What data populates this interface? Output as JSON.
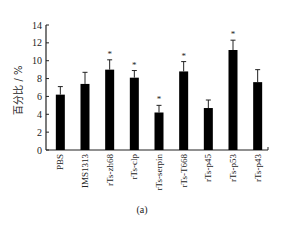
{
  "chart_data": {
    "type": "bar",
    "title": "",
    "caption": "(a)",
    "xlabel": "",
    "ylabel": "百分比 / %",
    "ylim": [
      0,
      14
    ],
    "yticks": [
      0,
      2,
      4,
      6,
      8,
      10,
      12,
      14
    ],
    "grid": false,
    "legend": null,
    "categories": [
      "PBS",
      "IMS1313",
      "rTs-zh68",
      "rTs-clp",
      "rTs-serpin",
      "rTs-T668",
      "rTs-p45",
      "rTs-p53",
      "rTs-p43"
    ],
    "values": [
      6.2,
      7.4,
      9.0,
      8.1,
      4.2,
      8.8,
      4.7,
      11.2,
      7.6
    ],
    "error_upper": [
      0.9,
      1.3,
      1.1,
      0.8,
      0.8,
      1.1,
      0.9,
      1.1,
      1.4
    ],
    "significance": [
      false,
      false,
      true,
      true,
      true,
      true,
      false,
      true,
      false
    ],
    "significance_marker": "*",
    "bar_color": "#000000"
  }
}
